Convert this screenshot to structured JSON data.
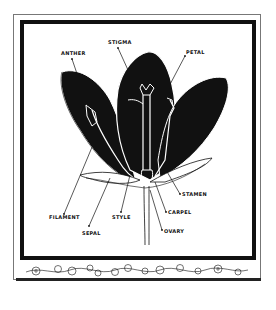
{
  "diagram": {
    "labels": {
      "anther": "ANTHER",
      "stigma": "STIGMA",
      "petal": "PETAL",
      "stamen": "STAMEN",
      "carpel": "CARPEL",
      "filament": "FILAMENT",
      "style": "STYLE",
      "ovary": "OVARY",
      "sepal": "SEPAL"
    },
    "border_decoration": "floral vine border",
    "colors": {
      "ink": "#111111",
      "paper": "#ffffff"
    }
  }
}
